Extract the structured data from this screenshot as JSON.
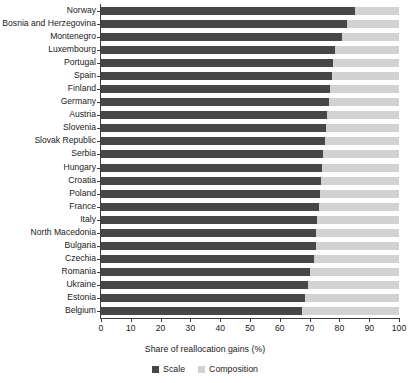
{
  "chart_data": {
    "type": "bar",
    "orientation": "horizontal",
    "stacked": true,
    "title": "",
    "xlabel": "Share of reallocation gains (%)",
    "ylabel": "",
    "xlim": [
      0,
      100
    ],
    "xticks": [
      0,
      10,
      20,
      30,
      40,
      50,
      60,
      70,
      80,
      90,
      100
    ],
    "xtick_labels": [
      "0",
      "10",
      "20",
      "30",
      "40",
      "50",
      "60",
      "70",
      "80",
      "90",
      "100"
    ],
    "grid": false,
    "legend_position": "bottom",
    "categories": [
      "Norway",
      "Bosnia and Herzegovina",
      "Montenegro",
      "Luxembourg",
      "Portugal",
      "Spain",
      "Finland",
      "Germany",
      "Austria",
      "Slovenia",
      "Slovak Republic",
      "Serbia",
      "Hungary",
      "Croatia",
      "Poland",
      "France",
      "Italy",
      "North Macedonia",
      "Bulgaria",
      "Czechia",
      "Romania",
      "Ukraine",
      "Estonia",
      "Belgium"
    ],
    "series": [
      {
        "name": "Scale",
        "color": "#474747",
        "values": [
          85.3,
          82.5,
          81.0,
          78.5,
          77.8,
          77.5,
          77.0,
          76.6,
          76.0,
          75.6,
          75.0,
          74.5,
          74.0,
          73.7,
          73.4,
          73.0,
          72.6,
          72.3,
          72.0,
          71.6,
          70.2,
          69.3,
          68.6,
          67.4
        ]
      },
      {
        "name": "Composition",
        "color": "#d2d2d2",
        "values": [
          14.7,
          17.5,
          19.0,
          21.5,
          22.2,
          22.5,
          23.0,
          23.4,
          24.0,
          24.4,
          25.0,
          25.5,
          26.0,
          26.3,
          26.6,
          27.0,
          27.4,
          27.7,
          28.0,
          28.4,
          29.8,
          30.7,
          31.4,
          32.6
        ]
      }
    ]
  },
  "legend": {
    "items": [
      {
        "label": "Scale",
        "color": "#474747"
      },
      {
        "label": "Composition",
        "color": "#d2d2d2"
      }
    ]
  },
  "axis": {
    "x_title": "Share of reallocation gains (%)"
  }
}
